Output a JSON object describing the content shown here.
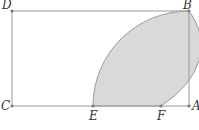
{
  "diagram": {
    "colors": {
      "line": "#9a9a9a",
      "shade": "#d9d9d9",
      "point": "#7a7a7a",
      "label": "#333333"
    },
    "points": {
      "D": {
        "label": "D",
        "x": 12,
        "y": 11
      },
      "B": {
        "label": "B",
        "x": 189,
        "y": 11
      },
      "C": {
        "label": "C",
        "x": 12,
        "y": 106
      },
      "A": {
        "label": "A",
        "x": 189,
        "y": 106
      },
      "E": {
        "label": "E",
        "x": 93,
        "y": 106
      },
      "F": {
        "label": "F",
        "x": 161,
        "y": 106
      }
    },
    "shaded_region": "Region bounded by arc E–B (centered at A), arc F–B (centered at C), and segment EF"
  }
}
